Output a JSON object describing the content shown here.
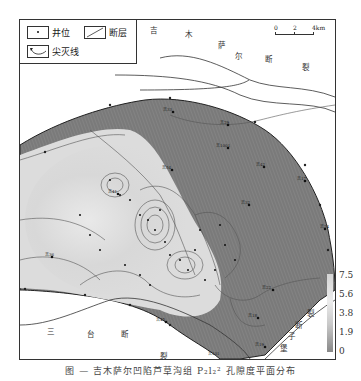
{
  "legend": {
    "well_label": "井位",
    "fault_label": "断层",
    "pinchout_label": "尖灭线"
  },
  "scale": {
    "ticks": [
      "0",
      "2",
      "4km"
    ]
  },
  "faults": [
    {
      "name": "吉木萨尔断裂",
      "chars": [
        "吉",
        "木",
        "萨",
        "尔",
        "断",
        "裂"
      ]
    },
    {
      "name": "三台断裂",
      "chars": [
        "三",
        "台",
        "断",
        "裂"
      ]
    },
    {
      "name": "后堡子断裂",
      "chars": [
        "后",
        "堡",
        "子",
        "断",
        "裂"
      ]
    }
  ],
  "wells": [
    {
      "label": "吉33",
      "x": 153,
      "y": 92
    },
    {
      "label": "吉29",
      "x": 208,
      "y": 105
    },
    {
      "label": "吉1001",
      "x": 208,
      "y": 128
    },
    {
      "label": "吉54",
      "x": 152,
      "y": 150
    },
    {
      "label": "吉42",
      "x": 244,
      "y": 147
    },
    {
      "label": "吉17",
      "x": 285,
      "y": 161
    },
    {
      "label": "吉32",
      "x": 229,
      "y": 185
    },
    {
      "label": "吉24",
      "x": 305,
      "y": 209
    },
    {
      "label": "吉41",
      "x": 98,
      "y": 174
    },
    {
      "label": "吉22",
      "x": 253,
      "y": 270
    },
    {
      "label": "吉36",
      "x": 32,
      "y": 237
    },
    {
      "label": "吉45",
      "x": 146,
      "y": 302
    },
    {
      "label": "吉18",
      "x": 238,
      "y": 298
    },
    {
      "label": "吉19",
      "x": 245,
      "y": 327
    },
    {
      "label": "吉101",
      "x": 224,
      "y": 347
    }
  ],
  "colorbar": {
    "ticks": [
      "7.5",
      "5.6",
      "3.8",
      "1.9",
      "0"
    ],
    "top_color": "#d3d3d3",
    "bottom_color": "#888888"
  },
  "caption": "图 — 吉木萨尔凹陷芦草沟组 P₂l₂² 孔隙度平面分布"
}
